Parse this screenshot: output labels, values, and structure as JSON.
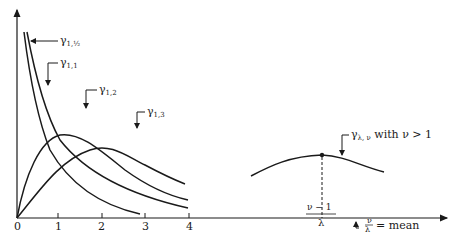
{
  "diagram": {
    "type": "gamma density curves",
    "x_axis": {
      "ticks": [
        "0",
        "1",
        "2",
        "3",
        "4"
      ]
    },
    "curves": [
      {
        "name": "gamma-1-half",
        "label": "γ",
        "sub": "1,½"
      },
      {
        "name": "gamma-1-1",
        "label": "γ",
        "sub": "1,1"
      },
      {
        "name": "gamma-1-2",
        "label": "γ",
        "sub": "1,2"
      },
      {
        "name": "gamma-1-3",
        "label": "γ",
        "sub": "1,3"
      }
    ],
    "general_curve": {
      "label": "γ",
      "sub": "λ, ν",
      "suffix": " with ν > 1"
    },
    "mode_label": {
      "numerator": "ν − 1",
      "denominator": "λ"
    },
    "mean_label": {
      "numerator": "ν",
      "denominator": "λ",
      "suffix": "= mean"
    }
  }
}
